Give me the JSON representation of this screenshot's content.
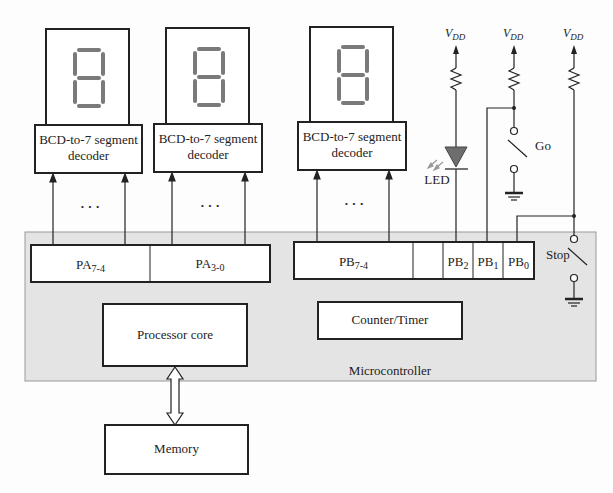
{
  "displays": [
    {
      "decoder_label_line1": "BCD-to-7 segment",
      "decoder_label_line2": "decoder",
      "digit": "8"
    },
    {
      "decoder_label_line1": "BCD-to-7 segment",
      "decoder_label_line2": "decoder",
      "digit": "8"
    },
    {
      "decoder_label_line1": "BCD-to-7 segment",
      "decoder_label_line2": "decoder",
      "digit": "8"
    }
  ],
  "ellipsis": "· · ·",
  "microcontroller": {
    "label": "Microcontroller",
    "port_a": [
      {
        "base": "PA",
        "sub": "7-4"
      },
      {
        "base": "PA",
        "sub": "3-0"
      }
    ],
    "port_b": [
      {
        "base": "PB",
        "sub": "7-4"
      },
      {
        "base": "",
        "sub": ""
      },
      {
        "base": "PB",
        "sub": "2"
      },
      {
        "base": "PB",
        "sub": "1"
      },
      {
        "base": "PB",
        "sub": "0"
      }
    ],
    "processor_core": "Processor core",
    "counter_timer": "Counter/Timer"
  },
  "memory": "Memory",
  "external": {
    "vdd_base": "V",
    "vdd_sub": "DD",
    "led_label": "LED",
    "go_label": "Go",
    "stop_label": "Stop"
  },
  "colors": {
    "mcu_fill": "#e4e4e4",
    "segment": "#7a7a7a",
    "led_fill": "#6e6e6e",
    "line": "#222222"
  }
}
